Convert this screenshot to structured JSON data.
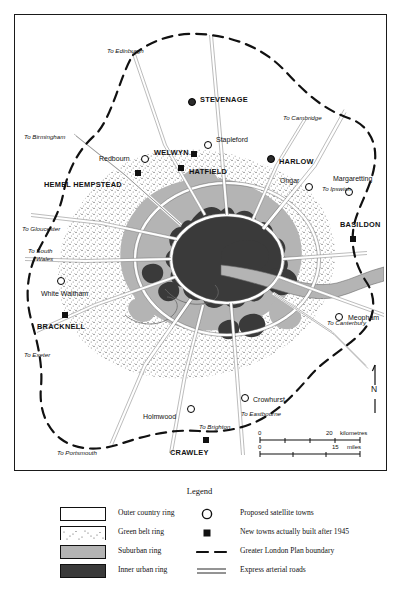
{
  "map": {
    "title": "Greater London Plan map",
    "towns_major": [
      {
        "name": "STEVENAGE",
        "x": 185,
        "y": 85,
        "mx": 173,
        "my": 83,
        "marker": "filled-dot"
      },
      {
        "name": "WELWYN",
        "x": 139,
        "y": 134,
        "mx": 176,
        "my": 136,
        "marker": "square"
      },
      {
        "name": "HATFIELD",
        "x": 175,
        "y": 156,
        "mx": 163,
        "my": 148,
        "marker": "square"
      },
      {
        "name": "HARLOW",
        "x": 266,
        "y": 145,
        "mx": 252,
        "my": 140,
        "marker": "filled-dot"
      },
      {
        "name": "HEMEL HEMPSTEAD",
        "x": 29,
        "y": 170,
        "mx": 120,
        "my": 155,
        "marker": "square"
      },
      {
        "name": "BASILDON",
        "x": 327,
        "y": 209,
        "mx": 335,
        "my": 221,
        "marker": "square"
      },
      {
        "name": "BRACKNELL",
        "x": 22,
        "y": 311,
        "mx": 47,
        "my": 297,
        "marker": "square"
      },
      {
        "name": "CRAWLEY",
        "x": 155,
        "y": 437,
        "mx": 188,
        "my": 422,
        "marker": "square"
      }
    ],
    "towns_minor": [
      {
        "name": "Redbourn",
        "x": 84,
        "y": 143,
        "mx": 126,
        "my": 143,
        "marker": "circle"
      },
      {
        "name": "Stapleford",
        "x": 202,
        "y": 126,
        "mx": 189,
        "my": 129,
        "marker": "circle"
      },
      {
        "name": "Ongar",
        "x": 267,
        "y": 165,
        "mx": 290,
        "my": 170,
        "marker": "circle"
      },
      {
        "name": "Margaretting",
        "x": 330,
        "y": 163,
        "mx": 330,
        "my": 176,
        "marker": "circle"
      },
      {
        "name": "Meopham",
        "x": 338,
        "y": 303,
        "mx": 322,
        "my": 301,
        "marker": "circle"
      },
      {
        "name": "White Waltham",
        "x": 28,
        "y": 281,
        "mx": 42,
        "my": 265,
        "marker": "circle"
      },
      {
        "name": "Holmwood",
        "x": 128,
        "y": 403,
        "mx": 172,
        "my": 393,
        "marker": "circle"
      },
      {
        "name": "Crowhurst",
        "x": 240,
        "y": 386,
        "mx": 226,
        "my": 383,
        "marker": "circle"
      }
    ],
    "road_labels": [
      {
        "text": "To Edinburgh",
        "x": 105,
        "y": 48
      },
      {
        "text": "To Cambridge",
        "x": 280,
        "y": 115
      },
      {
        "text": "To Birmingham",
        "x": 22,
        "y": 134
      },
      {
        "text": "To Ipswich",
        "x": 320,
        "y": 186
      },
      {
        "text": "To Gloucester",
        "x": 20,
        "y": 226
      },
      {
        "text": "To South",
        "x": 26,
        "y": 248
      },
      {
        "text": "Wales",
        "x": 34,
        "y": 256
      },
      {
        "text": "To Canterbury",
        "x": 325,
        "y": 320
      },
      {
        "text": "To Exeter",
        "x": 22,
        "y": 352
      },
      {
        "text": "To Eastbourne",
        "x": 239,
        "y": 411
      },
      {
        "text": "To Brighton",
        "x": 197,
        "y": 424
      },
      {
        "text": "To Portsmouth",
        "x": 55,
        "y": 450
      }
    ],
    "compass": {
      "label": "N",
      "x": 372,
      "y": 386
    },
    "scale": {
      "km_zero": "0",
      "km_max": "20",
      "km_unit": "kilometres",
      "mi_zero": "0",
      "mi_max": "15",
      "mi_unit": "miles"
    }
  },
  "legend": {
    "title": "Legend",
    "left_items": [
      {
        "label": "Outer country ring",
        "swatch": "outer-country"
      },
      {
        "label": "Green belt ring",
        "swatch": "green-belt"
      },
      {
        "label": "Suburban ring",
        "swatch": "suburban"
      },
      {
        "label": "Inner urban ring",
        "swatch": "inner-urban"
      }
    ],
    "right_items": [
      {
        "label": "Proposed satellite towns",
        "symbol": "open-circle"
      },
      {
        "label": "New towns actually built after 1945",
        "symbol": "filled-square"
      },
      {
        "label": "Greater London Plan boundary",
        "symbol": "dashed-line"
      },
      {
        "label": "Express arterial roads",
        "symbol": "double-line"
      }
    ]
  },
  "colors": {
    "inner_urban": "#3a3a3a",
    "suburban": "#b4b4b4",
    "green_belt": "#ffffff",
    "outer_country": "#ffffff",
    "ink": "#111111",
    "water": "#b4b4b4"
  }
}
